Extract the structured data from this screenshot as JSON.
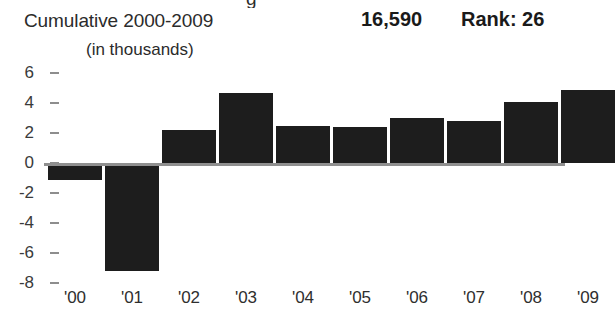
{
  "header": {
    "title": "Cumulative 2000-2009",
    "total": "16,590",
    "rank": "Rank: 26",
    "subtitle": "(in thousands)"
  },
  "colors": {
    "bar": "#1d1d1d",
    "axis": "#8f8f8f",
    "tick": "#8d8d8d",
    "text": "#2b2b2b",
    "background": "#ffffff"
  },
  "chart_data": {
    "type": "bar",
    "title": "Cumulative 2000-2009",
    "subtitle": "(in thousands)",
    "xlabel": "",
    "ylabel": "",
    "categories": [
      "'00",
      "'01",
      "'02",
      "'03",
      "'04",
      "'05",
      "'06",
      "'07",
      "'08",
      "'09"
    ],
    "values": [
      -1.1,
      -7.2,
      2.2,
      4.7,
      2.5,
      2.4,
      3.0,
      2.8,
      4.1,
      4.9
    ],
    "yticks": [
      6,
      4,
      2,
      0,
      -2,
      -4,
      -6,
      -8
    ],
    "ytick_labels": [
      "6",
      "4",
      "2",
      "0",
      "-2",
      "-4",
      "-6",
      "-8"
    ],
    "ylim": [
      -8,
      7
    ],
    "grid": false,
    "legend": false,
    "annotations": {
      "total": "16,590",
      "rank": "Rank: 26"
    }
  }
}
